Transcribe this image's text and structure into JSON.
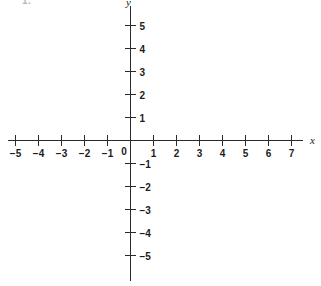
{
  "figure": {
    "item_number": "1.",
    "background_color": "#ffffff",
    "line_color": "#2b2b2b",
    "text_color": "#1c1c1c"
  },
  "chart_data": {
    "type": "scatter",
    "title": "",
    "subtitle": "",
    "xlabel": "x",
    "ylabel": "y",
    "xlim": [
      -5,
      7
    ],
    "ylim": [
      -5,
      5
    ],
    "grid": false,
    "legend": null,
    "series": [],
    "x_ticks": [
      -5,
      -4,
      -3,
      -2,
      -1,
      0,
      1,
      2,
      3,
      4,
      5,
      6,
      7
    ],
    "y_ticks": [
      -5,
      -4,
      -3,
      -2,
      -1,
      0,
      1,
      2,
      3,
      4,
      5
    ],
    "x_tick_labels": [
      "−5",
      "−4",
      "−3",
      "−2",
      "−1",
      "0",
      "1",
      "2",
      "3",
      "4",
      "5",
      "6",
      "7"
    ],
    "y_tick_labels": [
      "−5",
      "−4",
      "−3",
      "−2",
      "−1",
      "",
      "1",
      "2",
      "3",
      "4",
      "5"
    ],
    "origin_label": "0",
    "annotations": []
  },
  "axis_labels": {
    "x_axis_name": "x",
    "y_axis_name": "y"
  }
}
